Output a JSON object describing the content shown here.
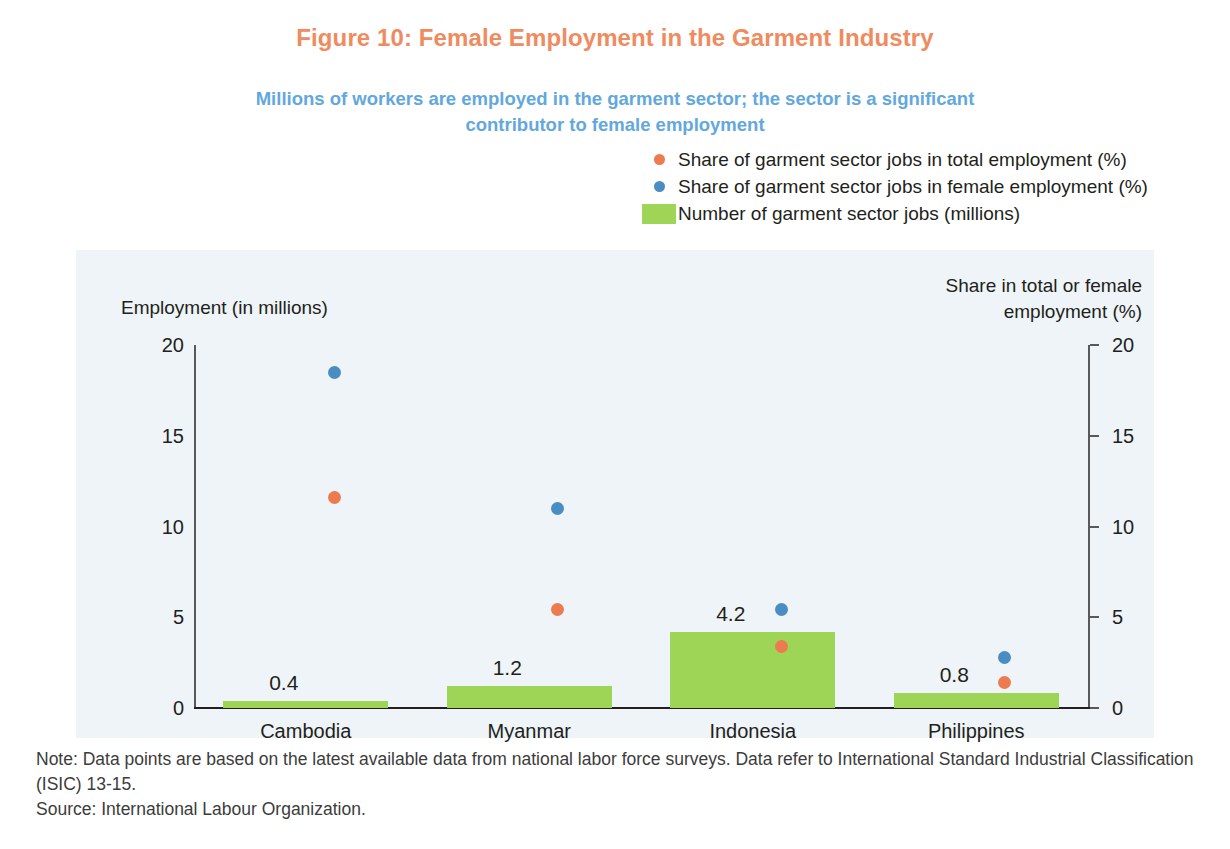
{
  "figure": {
    "title": "Figure 10: Female Employment in the Garment Industry",
    "subtitle": "Millions of workers are employed in the garment sector; the sector is a significant contributor to female employment",
    "title_color": "#ef8b5e",
    "subtitle_color": "#62a8de",
    "panel_background": "#eef4f7"
  },
  "legend": {
    "items": [
      {
        "label": "Share of garment sector jobs in total employment (%)",
        "marker": "orange-dot-marker",
        "color": "#ec7b4f"
      },
      {
        "label": "Share of garment sector jobs in female employment (%)",
        "marker": "blue-dot-marker",
        "color": "#4a8dc2"
      },
      {
        "label": "Number of garment sector jobs (millions)",
        "marker": "green-square-swatch",
        "color": "#9ed556"
      }
    ]
  },
  "axes": {
    "left_title": "Employment (in millions)",
    "right_title_line1": "Share in total or female",
    "right_title_line2": "employment (%)",
    "left_ticks": [
      "20",
      "15",
      "10",
      "5",
      "0"
    ],
    "right_ticks": [
      "20",
      "15",
      "10",
      "5",
      "0"
    ]
  },
  "footnote": {
    "note": "Note: Data points are based on the latest available data from national labor force surveys. Data refer to International Standard Industrial Classification (ISIC) 13-15.",
    "source": "Source: International Labour Organization."
  },
  "chart_data": {
    "type": "bar",
    "title": "Figure 10: Female Employment in the Garment Industry",
    "subtitle": "Millions of workers are employed in the garment sector; the sector is a significant contributor to female employment",
    "xlabel": "",
    "ylabel": "Employment (in millions)",
    "y2label": "Share in total or female employment (%)",
    "ylim": [
      0,
      20
    ],
    "y2lim": [
      0,
      20
    ],
    "yticks": [
      0,
      5,
      10,
      15,
      20
    ],
    "y2ticks": [
      0,
      5,
      10,
      15,
      20
    ],
    "grid": false,
    "legend_position": "top-right",
    "categories": [
      "Cambodia",
      "Myanmar",
      "Indonesia",
      "Philippines"
    ],
    "series": [
      {
        "name": "Number of garment sector jobs (millions)",
        "type": "bar",
        "axis": "left",
        "color": "#9ed556",
        "values": [
          0.4,
          1.2,
          4.2,
          0.8
        ],
        "data_labels": [
          "0.4",
          "1.2",
          "4.2",
          "0.8"
        ]
      },
      {
        "name": "Share of garment sector jobs in total employment (%)",
        "type": "scatter",
        "axis": "right",
        "color": "#ec7b4f",
        "values": [
          11.6,
          5.4,
          3.4,
          1.4
        ]
      },
      {
        "name": "Share of garment sector jobs in female employment (%)",
        "type": "scatter",
        "axis": "right",
        "color": "#4a8dc2",
        "values": [
          18.5,
          11.0,
          5.4,
          2.8
        ]
      }
    ],
    "note": "Note: Data points are based on the latest available data from national labor force surveys. Data refer to International Standard Industrial Classification (ISIC) 13-15.",
    "source": "Source: International Labour Organization."
  }
}
